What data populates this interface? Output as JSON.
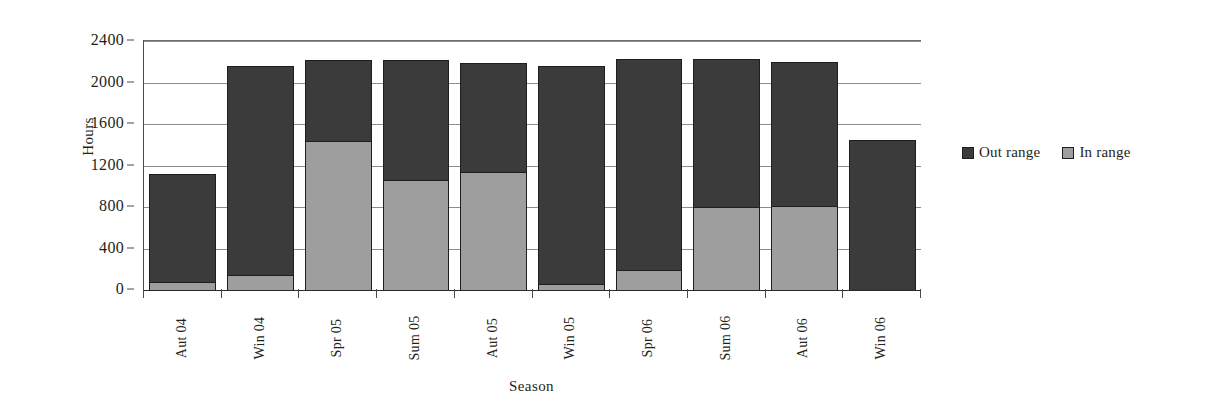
{
  "chart_data": {
    "type": "bar",
    "subtype": "stacked-vertical",
    "title": "",
    "xlabel": "Season",
    "ylabel": "Hours",
    "categories": [
      "Aut 04",
      "Win 04",
      "Spr 05",
      "Sum 05",
      "Aut 05",
      "Win 05",
      "Spr 06",
      "Sum 06",
      "Aut 06",
      "Win 06"
    ],
    "series": [
      {
        "name": "In range",
        "color": "#9e9e9e",
        "values": [
          80,
          140,
          1440,
          1060,
          1140,
          60,
          190,
          800,
          810,
          0
        ]
      },
      {
        "name": "Out range",
        "color": "#3b3b3b",
        "values": [
          1040,
          2020,
          780,
          1160,
          1050,
          2100,
          2040,
          1430,
          1390,
          1450
        ]
      }
    ],
    "totals": [
      1120,
      2160,
      2220,
      2220,
      2190,
      2160,
      2230,
      2230,
      2200,
      1450
    ],
    "ylim": [
      0,
      2400
    ],
    "ytick_step": 400,
    "yticks": [
      0,
      400,
      800,
      1200,
      1600,
      2000,
      2400
    ],
    "ytick_labels": [
      "0",
      "400",
      "800",
      "1200",
      "1600",
      "2000",
      "2400"
    ],
    "grid": true,
    "grid_axis": "y",
    "legend": [
      "Out range",
      "In range"
    ],
    "legend_position": "right",
    "stack_order_bottom_to_top": [
      "In range",
      "Out range"
    ]
  },
  "legend": {
    "items": [
      {
        "label": "Out range",
        "color": "#3b3b3b"
      },
      {
        "label": "In range",
        "color": "#9e9e9e"
      }
    ]
  },
  "axes": {
    "y_title": "Hours",
    "x_title": "Season"
  }
}
